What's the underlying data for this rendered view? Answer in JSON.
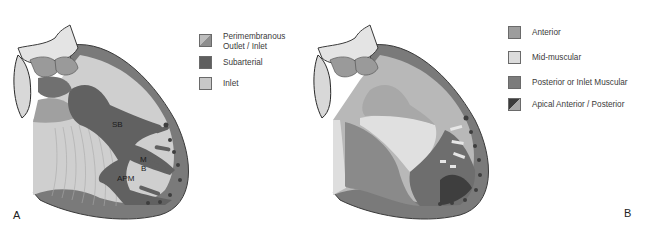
{
  "panel_a": {
    "label": "A",
    "heart_labels": {
      "sb": "SB",
      "mb_m": "M",
      "mb_b": "B",
      "apm": "APM"
    },
    "legend": [
      {
        "label_line1": "Perimembranous",
        "label_line2": "Outlet / Inlet",
        "swatch": "split",
        "color_a": "#8e8e8e",
        "color_b": "#bdbdbd"
      },
      {
        "label_line1": "Subarterial",
        "label_line2": "",
        "swatch": "solid",
        "color_a": "#5f5f5f",
        "color_b": ""
      },
      {
        "label_line1": "Inlet",
        "label_line2": "",
        "swatch": "solid",
        "color_a": "#c8c8c8",
        "color_b": ""
      }
    ]
  },
  "panel_b": {
    "label": "B",
    "legend": [
      {
        "label": "Anterior",
        "swatch": "solid",
        "color_a": "#9d9d9d",
        "color_b": ""
      },
      {
        "label": "Mid-muscular",
        "swatch": "solid",
        "color_a": "#dcdcdc",
        "color_b": ""
      },
      {
        "label": "Posterior or Inlet Muscular",
        "swatch": "solid",
        "color_a": "#7c7c7c",
        "color_b": ""
      },
      {
        "label": "Apical Anterior / Posterior",
        "swatch": "split",
        "color_a": "#3c3c3c",
        "color_b": "#a8a8a8"
      }
    ]
  },
  "colors": {
    "outer_wall": "#7a7a7a",
    "outline": "#3a3a3a",
    "septum_light": "#cfcfcf",
    "septum_mid": "#b3b3b3",
    "band_dark": "#616161",
    "valve_light": "#e4e4e4"
  }
}
